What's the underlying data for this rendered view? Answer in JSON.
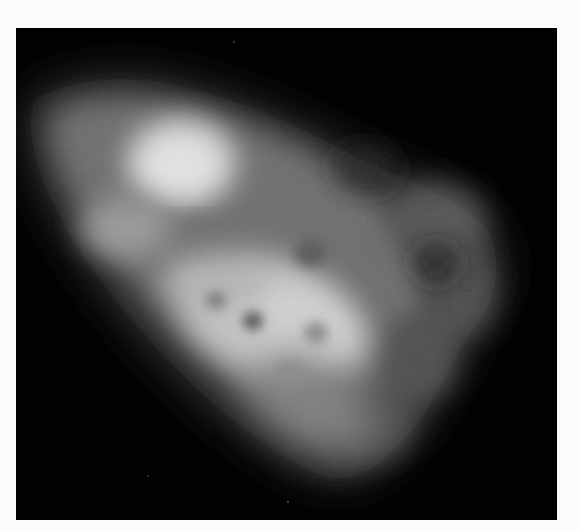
{
  "image": {
    "kind": "fluorescence-micrograph",
    "subject": "single cell",
    "colormap": "grayscale",
    "colors": {
      "background": "#020202",
      "frame": "#fbfbfb",
      "cell_dim": "#5a5a5a",
      "cell_mid": "#9a9a9a",
      "cell_bright": "#dcdcdc",
      "vacuole": "#4a4a4a"
    },
    "features": [
      "cell-body",
      "bright-upper-region",
      "bright-central-region",
      "dark-band",
      "vacuole-spots",
      "right-lobe-protrusions"
    ]
  }
}
